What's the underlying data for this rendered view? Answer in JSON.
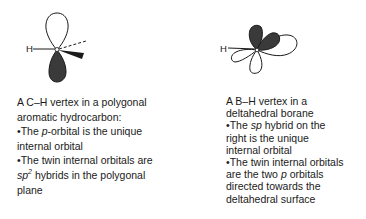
{
  "left_panel": {
    "diagram": {
      "atom_label": "H",
      "description": "C–H vertex with p-orbital (white upper lobe, dark lower lobe), dashed and wedged bonds",
      "colors": {
        "filled_lobe": "#3a3a3a",
        "outline": "#1a1a1a"
      }
    },
    "caption": {
      "line1": "A C–H vertex in a polygonal",
      "line2": "aromatic hydrocarbon:",
      "bullet1_prefix": "•The ",
      "bullet1_italic": "p",
      "bullet1_rest": "-orbital is the unique",
      "line4": "internal orbital",
      "line5": "•The twin internal orbitals are",
      "line6_italic": "sp",
      "line6_sup": "2",
      "line6_rest": " hybrids in the polygonal",
      "line7": "plane"
    }
  },
  "right_panel": {
    "diagram": {
      "atom_label": "H",
      "description": "B–H vertex with two dark p lobes above, white lobes below and an sp hybrid lobe to the right",
      "colors": {
        "filled_lobe": "#3a3a3a",
        "outline": "#1a1a1a"
      }
    },
    "caption": {
      "line1": "A B–H vertex in a",
      "line2": "deltahedral borane",
      "line3_prefix": "•The ",
      "line3_italic": "sp",
      "line3_rest": " hybrid on the",
      "line4": "right is the unique",
      "line5": "internal orbital",
      "line6": "•The twin internal orbitals",
      "line7_prefix": "are the two ",
      "line7_italic": "p",
      "line7_rest": " orbitals",
      "line8": "directed towards the",
      "line9": "deltahedral surface"
    }
  }
}
